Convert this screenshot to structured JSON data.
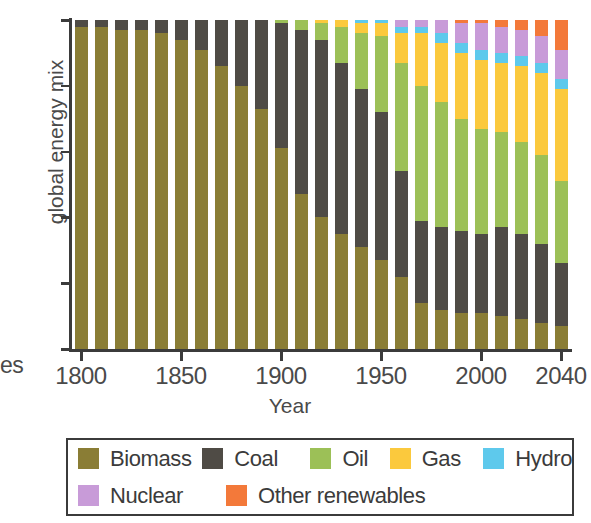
{
  "caption_fragment": "es",
  "axis": {
    "y_title": "global energy mix",
    "x_title": "Year",
    "y_ticks": [
      "0",
      "20",
      "40",
      "60",
      "80",
      "100"
    ],
    "x_ticks": [
      "1800",
      "1850",
      "1900",
      "1950",
      "2000",
      "2040"
    ]
  },
  "legend": {
    "rows": [
      [
        {
          "label": "Biomass",
          "color": "#8a7d35",
          "key": "biomass"
        },
        {
          "label": "Coal",
          "color": "#4f4b45",
          "key": "coal"
        },
        {
          "label": "Oil",
          "color": "#9cc057",
          "key": "oil"
        },
        {
          "label": "Gas",
          "color": "#fbc93d",
          "key": "gas"
        },
        {
          "label": "Hydro",
          "color": "#5ec9ec",
          "key": "hydro"
        }
      ],
      [
        {
          "label": "Nuclear",
          "color": "#c89bd8",
          "key": "nuclear"
        },
        {
          "label": "Other renewables",
          "color": "#f3793a",
          "key": "other_renewables"
        }
      ]
    ]
  },
  "chart_data": {
    "type": "bar",
    "stacked": true,
    "title": "",
    "xlabel": "Year",
    "ylabel": "global energy mix",
    "ylim": [
      0,
      100
    ],
    "xlim": [
      1795,
      2045
    ],
    "grid": false,
    "legend_position": "bottom",
    "colors": {
      "Biomass": "#8a7d35",
      "Coal": "#4f4b45",
      "Oil": "#9cc057",
      "Gas": "#fbc93d",
      "Hydro": "#5ec9ec",
      "Nuclear": "#c89bd8",
      "Other renewables": "#f3793a"
    },
    "categories": [
      1800,
      1810,
      1820,
      1830,
      1840,
      1850,
      1860,
      1870,
      1880,
      1890,
      1900,
      1910,
      1920,
      1930,
      1940,
      1950,
      1960,
      1970,
      1980,
      1990,
      2000,
      2010,
      2020,
      2030,
      2040
    ],
    "series": [
      {
        "name": "Biomass",
        "values": [
          98,
          98,
          97,
          97,
          96,
          94,
          91,
          86,
          80,
          73,
          61,
          47,
          40,
          35,
          31,
          27,
          22,
          14,
          12,
          11,
          11,
          10,
          9,
          8,
          7
        ]
      },
      {
        "name": "Coal",
        "values": [
          2,
          2,
          3,
          3,
          4,
          6,
          9,
          14,
          20,
          27,
          38,
          50,
          54,
          52,
          48,
          45,
          32,
          25,
          25,
          25,
          24,
          27,
          26,
          24,
          19
        ]
      },
      {
        "name": "Oil",
        "values": [
          0,
          0,
          0,
          0,
          0,
          0,
          0,
          0,
          0,
          0,
          1,
          3,
          5,
          11,
          17,
          23,
          33,
          41,
          38,
          34,
          32,
          29,
          28,
          27,
          25
        ]
      },
      {
        "name": "Gas",
        "values": [
          0,
          0,
          0,
          0,
          0,
          0,
          0,
          0,
          0,
          0,
          0,
          0,
          1,
          2,
          3,
          4,
          9,
          16,
          18,
          20,
          21,
          21,
          23,
          25,
          28
        ]
      },
      {
        "name": "Hydro",
        "values": [
          0,
          0,
          0,
          0,
          0,
          0,
          0,
          0,
          0,
          0,
          0,
          0,
          0,
          0,
          1,
          1,
          2,
          2,
          3,
          3,
          3,
          3,
          3,
          3,
          3
        ]
      },
      {
        "name": "Nuclear",
        "values": [
          0,
          0,
          0,
          0,
          0,
          0,
          0,
          0,
          0,
          0,
          0,
          0,
          0,
          0,
          0,
          0,
          2,
          2,
          4,
          6,
          8,
          8,
          8,
          8,
          9
        ]
      },
      {
        "name": "Other renewables",
        "values": [
          0,
          0,
          0,
          0,
          0,
          0,
          0,
          0,
          0,
          0,
          0,
          0,
          0,
          0,
          0,
          0,
          0,
          0,
          0,
          1,
          1,
          2,
          3,
          5,
          9
        ]
      }
    ]
  }
}
